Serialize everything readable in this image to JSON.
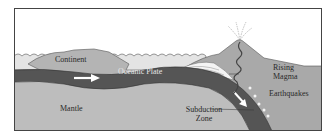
{
  "diagram": {
    "type": "subduction-zone cross-section",
    "labels": {
      "continent": "Continent",
      "oceanic_plate": "Oceanic Plate",
      "mantle": "Mantle",
      "subduction_zone_line1": "Subduction",
      "subduction_zone_line2": "Zone",
      "rising_magma_line1": "Rising",
      "rising_magma_line2": "Magma",
      "earthquakes": "Earthquakes"
    },
    "colors": {
      "sky": "#ffffff",
      "ocean": "#e4e4e4",
      "continent": "#b4b4b4",
      "oceanic_plate": "#555555",
      "mantle": "#bdbdbd",
      "volcano": "#a9a9a9",
      "border": "#444444",
      "arrow": "#ffffff"
    }
  }
}
